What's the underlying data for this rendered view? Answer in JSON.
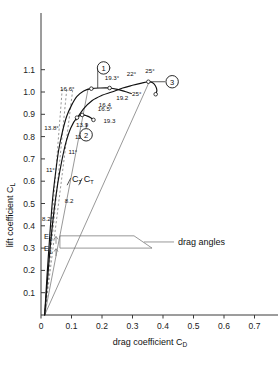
{
  "chart_data": {
    "type": "line",
    "title": "",
    "xlabel": "drag coefficient C_D",
    "ylabel": "lift coefficient C_L",
    "xlim": [
      0,
      0.78
    ],
    "ylim": [
      0,
      1.16
    ],
    "xticks": [
      "0",
      "0.1",
      "0.2",
      "0.3",
      "0.4",
      "0.5",
      "0.6",
      "0.7"
    ],
    "xtick_values": [
      0,
      0.1,
      0.2,
      0.3,
      0.4,
      0.5,
      0.6,
      0.7
    ],
    "yticks": [
      "0.1",
      "0.2",
      "0.3",
      "0.4",
      "0.5",
      "0.6",
      "0.7",
      "0.8",
      "0.9",
      "1.0",
      "1.1"
    ],
    "ytick_values": [
      0.1,
      0.2,
      0.3,
      0.4,
      0.5,
      0.6,
      0.7,
      0.8,
      0.9,
      1.0,
      1.1
    ],
    "grid": false,
    "legend": "none",
    "series": [
      {
        "name": "polar-1",
        "label": "1",
        "points": [
          [
            0.012,
            0.0
          ],
          [
            0.02,
            0.18
          ],
          [
            0.029,
            0.36
          ],
          [
            0.038,
            0.52
          ],
          [
            0.048,
            0.64
          ],
          [
            0.058,
            0.74
          ],
          [
            0.07,
            0.82
          ],
          [
            0.084,
            0.89
          ],
          [
            0.1,
            0.94
          ],
          [
            0.118,
            0.98
          ],
          [
            0.14,
            1.005
          ],
          [
            0.165,
            1.015
          ],
          [
            0.195,
            1.018
          ],
          [
            0.225,
            1.018
          ],
          [
            0.25,
            1.012
          ],
          [
            0.275,
            1.002
          ],
          [
            0.296,
            0.993
          ]
        ]
      },
      {
        "name": "polar-2",
        "label": "2",
        "points": [
          [
            0.012,
            0.0
          ],
          [
            0.022,
            0.17
          ],
          [
            0.032,
            0.33
          ],
          [
            0.043,
            0.47
          ],
          [
            0.055,
            0.59
          ],
          [
            0.068,
            0.69
          ],
          [
            0.082,
            0.775
          ],
          [
            0.098,
            0.84
          ],
          [
            0.118,
            0.885
          ],
          [
            0.135,
            0.897
          ],
          [
            0.15,
            0.893
          ],
          [
            0.163,
            0.885
          ],
          [
            0.172,
            0.875
          ]
        ]
      },
      {
        "name": "polar-3",
        "label": "3",
        "points": [
          [
            0.115,
            0.875
          ],
          [
            0.14,
            0.925
          ],
          [
            0.168,
            0.962
          ],
          [
            0.2,
            0.985
          ],
          [
            0.232,
            1.0
          ],
          [
            0.268,
            1.018
          ],
          [
            0.3,
            1.03
          ],
          [
            0.33,
            1.04
          ],
          [
            0.352,
            1.046
          ],
          [
            0.366,
            1.042
          ],
          [
            0.375,
            1.028
          ],
          [
            0.38,
            1.008
          ],
          [
            0.376,
            0.99
          ]
        ]
      }
    ],
    "drag_lines": [
      {
        "name": "CT-line-1",
        "x1": 0.012,
        "y1": 0.0,
        "x2": 0.155,
        "y2": 1.018
      },
      {
        "name": "CT-line-2",
        "x1": 0.012,
        "y1": 0.0,
        "x2": 0.355,
        "y2": 1.046
      },
      {
        "name": "eps-line-1",
        "x1": 0.012,
        "y1": 0.0,
        "x2": 0.105,
        "y2": 1.02
      },
      {
        "name": "eps-line-2",
        "x1": 0.012,
        "y1": 0.0,
        "x2": 0.085,
        "y2": 1.02
      },
      {
        "name": "eps-line-3",
        "x1": 0.012,
        "y1": 0.0,
        "x2": 0.07,
        "y2": 1.02
      }
    ],
    "angle_annotations": [
      {
        "text": "11°",
        "x": 0.062,
        "y": 0.635,
        "dx": -14,
        "dy": -1
      },
      {
        "text": "11°",
        "x": 0.09,
        "y": 0.715,
        "dx": 0,
        "dy": -2
      },
      {
        "text": "11.2°",
        "x": 0.098,
        "y": 0.79,
        "dx": 4,
        "dy": 0
      },
      {
        "text": "13.8°",
        "x": 0.083,
        "y": 0.84,
        "dx": -22,
        "dy": 2
      },
      {
        "text": "13.9",
        "x": 0.128,
        "y": 0.877,
        "dx": -4,
        "dy": 8
      },
      {
        "text": "16.6°",
        "x": 0.128,
        "y": 1.0,
        "dx": -20,
        "dy": -1
      },
      {
        "text": "16.4",
        "x": 0.183,
        "y": 0.94,
        "dx": 2,
        "dy": 2
      },
      {
        "text": "16.5°",
        "x": 0.16,
        "y": 0.905,
        "dx": 8,
        "dy": -2
      },
      {
        "text": "19.3",
        "x": 0.175,
        "y": 0.88,
        "dx": 9,
        "dy": 4
      },
      {
        "text": "19.3°",
        "x": 0.222,
        "y": 1.025,
        "dx": -4,
        "dy": -6
      },
      {
        "text": "19.2",
        "x": 0.24,
        "y": 1.0,
        "dx": 2,
        "dy": 8
      },
      {
        "text": "22°",
        "x": 0.288,
        "y": 1.04,
        "dx": -2,
        "dy": -7
      },
      {
        "text": "25°",
        "x": 0.352,
        "y": 1.052,
        "dx": -3,
        "dy": -7
      },
      {
        "text": "25°",
        "x": 0.292,
        "y": 0.998,
        "dx": 2,
        "dy": 4
      },
      {
        "text": "8.2",
        "x": 0.068,
        "y": 0.505,
        "dx": 3,
        "dy": 1
      },
      {
        "text": "8.2°",
        "x": 0.043,
        "y": 0.425,
        "dx": -12,
        "dy": 1
      }
    ],
    "curve_labels": [
      {
        "text": "C",
        "sub": "T",
        "x": 0.102,
        "y": 0.6
      },
      {
        "text": "C",
        "sub": "T",
        "x": 0.14,
        "y": 0.6
      }
    ],
    "markers": [
      {
        "label": "1",
        "cx": 0.205,
        "cy": 1.108,
        "leader_to_x": 0.186,
        "leader_to_y": 1.018
      },
      {
        "label": "2",
        "cx": 0.148,
        "cy": 0.808,
        "leader_to_x": 0.15,
        "leader_to_y": 0.86
      },
      {
        "label": "3",
        "cx": 0.43,
        "cy": 1.046,
        "leader_to_x": 0.358,
        "leader_to_y": 1.046
      }
    ],
    "drag_angle_callout": {
      "label": "drag angles",
      "eps2_label": "E",
      "eps2_sub": "2",
      "eps1_label": "E",
      "eps1_sub": "1",
      "eps2_y": 0.355,
      "eps1_y": 0.3,
      "box_x": 0.062,
      "leader_x": 0.305
    }
  },
  "colors": {
    "axis": "#3a3a3a",
    "curve": "#111111",
    "thin": "#6b6b6b",
    "text": "#111111",
    "background": "#ffffff"
  }
}
